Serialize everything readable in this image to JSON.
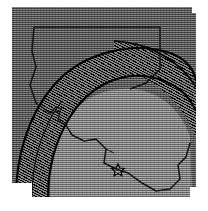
{
  "figure": {
    "kind": "halftone-printed-map-figure",
    "title": "",
    "subtitle": "",
    "notes": "",
    "frame": {
      "visible": true,
      "color": "#2a2a2a",
      "x": 10,
      "y": 7,
      "width": 186,
      "height": 190
    },
    "background": {
      "fill": "#6b6b6b",
      "texture": "horizontal-scanline-halftone"
    }
  },
  "map": {
    "region_label": "",
    "state_outline": {
      "name": "state-boundary",
      "stroke": "#141414",
      "visible": true
    },
    "coastline": {
      "name": "coastline",
      "stroke": "#141414",
      "visible": true
    }
  },
  "overlay": {
    "wave_band": {
      "name": "wave-front-band",
      "fill": "#3a3a3a",
      "texture": "diagonal-moire-halftone",
      "visible": true,
      "label": ""
    },
    "interior_zone": {
      "name": "interior-zone",
      "fill": "#8b8b8b",
      "texture": "horizontal-scanline-halftone",
      "visible": true,
      "label": ""
    },
    "front_line": {
      "name": "wave-front-line",
      "stroke": "#000000",
      "visible": true
    }
  },
  "markers": [
    {
      "name": "epicenter-star",
      "glyph": "star-icon",
      "x": 118,
      "y": 170,
      "label": "",
      "color": "#000000"
    }
  ],
  "legend": {
    "visible": false,
    "entries": []
  },
  "axes": {
    "visible": false,
    "xlabel": "",
    "ylabel": "",
    "ticks": []
  },
  "colors": {
    "paper": "#ffffff",
    "frame": "#2a2a2a",
    "field_gray": "#6b6b6b",
    "interior_gray": "#8b8b8b",
    "band_dark": "#3a3a3a",
    "ink": "#141414"
  }
}
